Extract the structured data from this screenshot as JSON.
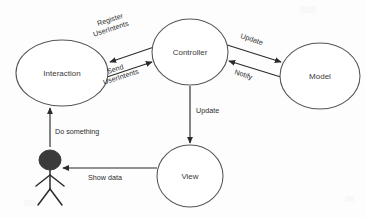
{
  "diagram": {
    "type": "uml-collaboration-diagram",
    "background_color": "#fdfdfd",
    "stroke_color": "#2b2b2b",
    "node_fill_color": "#ffffff",
    "node_stroke_color": "#555555",
    "actor_head_color": "#3b3b3b"
  },
  "nodes": [
    {
      "id": "interaction",
      "label": "Interaction",
      "shape": "ellipse",
      "cx": 62,
      "cy": 73,
      "rx": 46,
      "ry": 33
    },
    {
      "id": "controller",
      "label": "Controller",
      "shape": "ellipse",
      "cx": 190,
      "cy": 52,
      "rx": 38,
      "ry": 33
    },
    {
      "id": "model",
      "label": "Model",
      "shape": "ellipse",
      "cx": 320,
      "cy": 76,
      "rx": 40,
      "ry": 33
    },
    {
      "id": "view",
      "label": "View",
      "shape": "ellipse",
      "cx": 190,
      "cy": 176,
      "rx": 33,
      "ry": 31
    },
    {
      "id": "actor",
      "label": "",
      "shape": "stick-figure",
      "cx": 50,
      "cy": 160
    }
  ],
  "edges": [
    {
      "id": "register-userintents",
      "from": "controller",
      "to": "interaction",
      "label": "Register\nUserIntents",
      "label_line1": "Register",
      "label_line2": "UserIntents",
      "direction": "left",
      "rotated": true
    },
    {
      "id": "send-userintents",
      "from": "interaction",
      "to": "controller",
      "label": "Send\nUserIntents",
      "label_line1": "Send",
      "label_line2": "UserIntents",
      "direction": "right",
      "rotated": true
    },
    {
      "id": "update-model",
      "from": "controller",
      "to": "model",
      "label": "Update",
      "direction": "right",
      "rotated": true
    },
    {
      "id": "notify",
      "from": "model",
      "to": "controller",
      "label": "Notify",
      "direction": "left",
      "rotated": true
    },
    {
      "id": "update-view",
      "from": "controller",
      "to": "view",
      "label": "Update",
      "direction": "down",
      "rotated": false
    },
    {
      "id": "show-data",
      "from": "view",
      "to": "actor",
      "label": "Show data",
      "direction": "left",
      "rotated": false
    },
    {
      "id": "do-something",
      "from": "actor",
      "to": "interaction",
      "label": "Do something",
      "direction": "up",
      "rotated": false
    }
  ]
}
